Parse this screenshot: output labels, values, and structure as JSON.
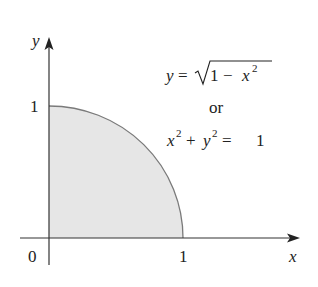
{
  "figure": {
    "axes": {
      "x_label": "x",
      "y_label": "y",
      "origin_label": "0",
      "x_tick_label": "1",
      "y_tick_label": "1"
    },
    "equation": {
      "line1_lhs": "y",
      "line1_eq": "=",
      "line1_rad_1": "1",
      "line1_minus": "−",
      "line1_x": "x",
      "line1_exp": "2",
      "line2": "or",
      "line3_x": "x",
      "line3_x_exp": "2",
      "line3_plus": "+",
      "line3_y": "y",
      "line3_y_exp": "2",
      "line3_eq": "=",
      "line3_rhs": "1"
    },
    "colors": {
      "fill": "#e6e6e6",
      "curve": "#7a7a7a",
      "axis": "#333333"
    },
    "region": "quarter disk x^2 + y^2 <= 1, x >= 0, y >= 0 (shaded)"
  }
}
